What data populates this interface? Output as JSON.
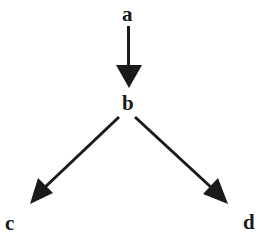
{
  "diagram": {
    "type": "directed-tree",
    "colors": {
      "stroke": "#1a1a1a",
      "background": "#ffffff"
    },
    "nodes": [
      {
        "id": "a",
        "label": "a"
      },
      {
        "id": "b",
        "label": "b"
      },
      {
        "id": "c",
        "label": "c"
      },
      {
        "id": "d",
        "label": "d"
      }
    ],
    "edges": [
      {
        "from": "a",
        "to": "b"
      },
      {
        "from": "b",
        "to": "c"
      },
      {
        "from": "b",
        "to": "d"
      }
    ]
  }
}
